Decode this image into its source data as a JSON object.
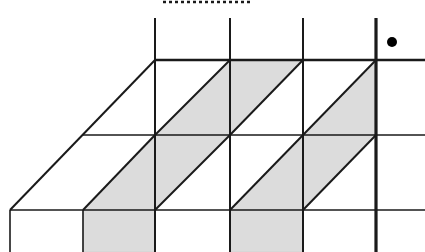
{
  "figure": {
    "width": 425,
    "height": 252,
    "background_color": "#ffffff",
    "stroke_color": "#1a1a1a",
    "shade_color": "#dcdcdc",
    "shade_edge_color": "#c8c8c8"
  },
  "geometry": {
    "description": "Sheared lattice: three horizontal rules, four vertical rules, 45-degree diagonals forming shaded triangles and parallelograms.",
    "cell_width": 73,
    "cell_height": 75,
    "shear_per_row": 73,
    "column_x": [
      155,
      230,
      303,
      376
    ],
    "row_y": [
      60,
      135,
      210
    ],
    "origin_bottom_left": [
      10,
      210
    ],
    "diagonal_slope_label": "45 degrees, rising left-to-right"
  },
  "elements": {
    "dotted_rule": {
      "name": "top-dotted-rule",
      "x1": 163,
      "x2": 253,
      "y": 2,
      "dash_pattern": "3 3",
      "color": "#1a1a1a"
    },
    "marker_dot": {
      "name": "lattice-point-dot",
      "cx": 392,
      "cy": 42,
      "r": 5,
      "color": "#000000"
    },
    "thick_vertical": {
      "name": "emphasis-vertical-axis",
      "x": 376,
      "y1": 18,
      "y2": 252,
      "width": 3.2
    }
  },
  "lines": {
    "horizontals": [
      {
        "label": "top-rule",
        "x1": 155,
        "x2": 425,
        "y": 60,
        "width": 2.6
      },
      {
        "label": "middle-rule",
        "x1": 83,
        "x2": 425,
        "y": 135,
        "width": 1.6
      },
      {
        "label": "bottom-rule",
        "x1": 10,
        "x2": 425,
        "y": 210,
        "width": 1.6
      }
    ],
    "verticals": [
      {
        "label": "col-1",
        "x": 155,
        "y1": 18,
        "y2": 252,
        "width": 2.0
      },
      {
        "label": "col-2",
        "x": 230,
        "y1": 18,
        "y2": 252,
        "width": 2.0
      },
      {
        "label": "col-3",
        "x": 303,
        "y1": 18,
        "y2": 252,
        "width": 2.0
      },
      {
        "label": "col-left-stub",
        "x": 10,
        "y1": 210,
        "y2": 252,
        "width": 1.6
      },
      {
        "label": "col-left-stub-2",
        "x": 83,
        "y1": 210,
        "y2": 252,
        "width": 1.6
      }
    ],
    "diagonals": [
      {
        "label": "edge-outer-left",
        "x1": 10,
        "y1": 210,
        "x2": 155,
        "y2": 60,
        "width": 2.0
      },
      {
        "label": "diag-row1-a",
        "x1": 83,
        "y1": 210,
        "x2": 155,
        "y2": 135,
        "width": 2.0
      },
      {
        "label": "diag-row1-b",
        "x1": 155,
        "y1": 210,
        "x2": 230,
        "y2": 135,
        "width": 2.0
      },
      {
        "label": "diag-row1-c",
        "x1": 230,
        "y1": 210,
        "x2": 303,
        "y2": 135,
        "width": 2.0
      },
      {
        "label": "diag-row1-d",
        "x1": 303,
        "y1": 210,
        "x2": 376,
        "y2": 135,
        "width": 2.0
      },
      {
        "label": "diag-row2-a",
        "x1": 155,
        "y1": 135,
        "x2": 230,
        "y2": 60,
        "width": 2.0
      },
      {
        "label": "diag-row2-b",
        "x1": 230,
        "y1": 135,
        "x2": 303,
        "y2": 60,
        "width": 2.0
      },
      {
        "label": "diag-row2-c",
        "x1": 303,
        "y1": 135,
        "x2": 376,
        "y2": 60,
        "width": 2.0
      }
    ]
  },
  "shaded_regions": [
    {
      "label": "shade-upper-1",
      "points": "155,135 230,60 303,60 230,135"
    },
    {
      "label": "shade-upper-2",
      "points": "303,135 376,60 376,135"
    },
    {
      "label": "shade-lower-1",
      "points": "83,210 155,135 230,135 155,210"
    },
    {
      "label": "shade-lower-2",
      "points": "230,210 303,135 376,135 303,210"
    },
    {
      "label": "shade-foot-1",
      "points": "83,210 155,210 155,252 83,252"
    },
    {
      "label": "shade-foot-2",
      "points": "230,210 303,210 303,252 230,252"
    }
  ]
}
